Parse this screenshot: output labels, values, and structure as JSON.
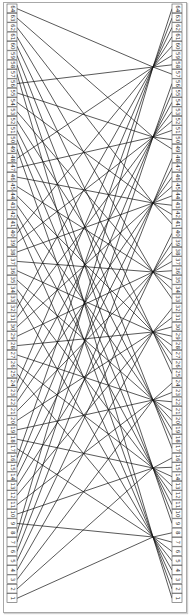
{
  "diagram": {
    "type": "permutation-network",
    "box_count_per_column": 64,
    "group_size": 8,
    "left_column": {
      "labels_bottom_to_top": [
        1,
        2,
        3,
        4,
        5,
        6,
        7,
        8,
        9,
        10,
        11,
        12,
        13,
        14,
        15,
        16,
        17,
        18,
        19,
        20,
        21,
        22,
        23,
        24,
        25,
        26,
        27,
        28,
        29,
        30,
        31,
        32,
        33,
        34,
        35,
        36,
        37,
        38,
        39,
        40,
        41,
        42,
        43,
        44,
        45,
        46,
        47,
        48,
        49,
        50,
        51,
        52,
        53,
        54,
        55,
        56,
        57,
        58,
        59,
        60,
        61,
        62,
        63,
        64
      ]
    },
    "right_column": {
      "labels_bottom_to_top": [
        1,
        2,
        3,
        4,
        5,
        6,
        7,
        8,
        9,
        10,
        11,
        12,
        13,
        14,
        15,
        16,
        17,
        18,
        19,
        20,
        21,
        22,
        23,
        24,
        25,
        26,
        27,
        28,
        29,
        30,
        31,
        32,
        33,
        34,
        35,
        36,
        37,
        38,
        39,
        40,
        41,
        42,
        43,
        44,
        45,
        46,
        47,
        48,
        49,
        50,
        51,
        52,
        53,
        54,
        55,
        56,
        57,
        58,
        59,
        60,
        61,
        62,
        63,
        64
      ]
    },
    "hub_points_bottom_to_top_y": [
      537,
      468,
      400,
      332,
      272,
      203,
      137,
      67
    ],
    "hub_x": 153,
    "line_color": "#111111",
    "box_border_color": "#555555",
    "frame_color": "#a8a8a8"
  }
}
